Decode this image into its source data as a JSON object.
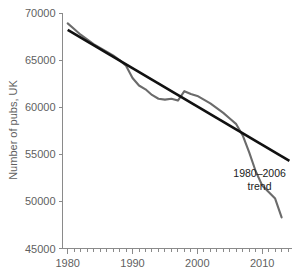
{
  "chart_data": {
    "type": "line",
    "title": "",
    "xlabel": "",
    "ylabel": "Number of pubs, UK",
    "xlim": [
      1979.2,
      2014.6
    ],
    "ylim": [
      45000,
      70000
    ],
    "grid": false,
    "legend_position": "none",
    "y_ticks": [
      45000,
      50000,
      55000,
      60000,
      65000,
      70000
    ],
    "y_tick_labels": [
      "45000",
      "50000",
      "55000",
      "60000",
      "65000",
      "70000"
    ],
    "x_ticks": [
      1980,
      1990,
      2000,
      2010
    ],
    "x_tick_labels": [
      "1980",
      "1990",
      "2000",
      "2010"
    ],
    "x_minor_tick_step": 1,
    "series": [
      {
        "name": "Number of pubs, UK",
        "color": "#6b6b6b",
        "x": [
          1980,
          1981,
          1982,
          1983,
          1984,
          1985,
          1986,
          1987,
          1988,
          1989,
          1990,
          1991,
          1992,
          1993,
          1994,
          1995,
          1996,
          1997,
          1998,
          1999,
          2000,
          2001,
          2002,
          2003,
          2004,
          2005,
          2006,
          2007,
          2008,
          2009,
          2010,
          2011,
          2012,
          2013
        ],
        "values": [
          68900,
          68300,
          67700,
          67200,
          66700,
          66300,
          65900,
          65500,
          65000,
          64400,
          63100,
          62300,
          61900,
          61300,
          60900,
          60800,
          60900,
          60700,
          61700,
          61400,
          61200,
          60800,
          60400,
          59900,
          59400,
          58800,
          58200,
          57000,
          55200,
          53200,
          51700,
          51000,
          50300,
          48300
        ]
      },
      {
        "name": "1980-2006 trend",
        "color": "#111111",
        "type": "trend",
        "fit_range": [
          1980,
          2006
        ],
        "drawn_range": [
          1980,
          2014.2
        ],
        "start_value": 68200,
        "end_value": 54300
      }
    ],
    "annotations": [
      {
        "name": "trend-annotation",
        "lines": [
          "1980–2006",
          "trend"
        ],
        "x": 2009.6,
        "y": 52600
      }
    ]
  }
}
